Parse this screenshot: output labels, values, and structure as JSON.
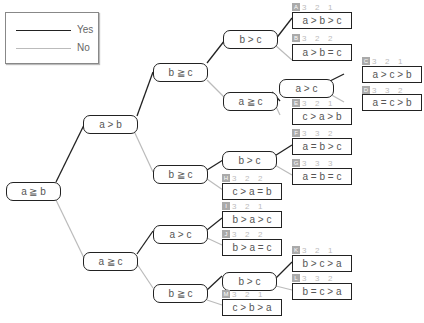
{
  "legend": {
    "yes_label": "Yes",
    "no_label": "No",
    "yes_color": "#222222",
    "no_color": "#bbbbbb"
  },
  "nodes": {
    "root": "a ≧ b",
    "n1": "a > b",
    "n1y": "b ≧ c",
    "n1yy": "b > c",
    "n1yn": "a ≧ c",
    "n1yna": "a > c",
    "n1n": "b ≧ c",
    "n1nb": "b > c",
    "n2": "a ≧ c",
    "n2y": "a > c",
    "n2n": "b ≧ c",
    "n2nb": "b > c"
  },
  "leaves": [
    {
      "id": "A",
      "text": "a > b > c",
      "scores": [
        "3",
        "2",
        "1"
      ]
    },
    {
      "id": "B",
      "text": "a > b = c",
      "scores": [
        "3",
        "2",
        "2"
      ]
    },
    {
      "id": "C",
      "text": "a > c > b",
      "scores": [
        "3",
        "2",
        "1"
      ]
    },
    {
      "id": "D",
      "text": "a = c > b",
      "scores": [
        "3",
        "3",
        "2"
      ]
    },
    {
      "id": "E",
      "text": "c > a > b",
      "scores": [
        "3",
        "2",
        "1"
      ]
    },
    {
      "id": "F",
      "text": "a = b > c",
      "scores": [
        "3",
        "3",
        "2"
      ]
    },
    {
      "id": "G",
      "text": "a = b = c",
      "scores": [
        "3",
        "3",
        "3"
      ]
    },
    {
      "id": "H",
      "text": "c > a = b",
      "scores": [
        "3",
        "2",
        "2"
      ]
    },
    {
      "id": "I",
      "text": "b > a > c",
      "scores": [
        "3",
        "2",
        "1"
      ]
    },
    {
      "id": "J",
      "text": "b > a = c",
      "scores": [
        "3",
        "2",
        "2"
      ]
    },
    {
      "id": "K",
      "text": "b > c > a",
      "scores": [
        "3",
        "2",
        "1"
      ]
    },
    {
      "id": "L",
      "text": "b = c > a",
      "scores": [
        "3",
        "3",
        "2"
      ]
    },
    {
      "id": "M",
      "text": "c > b > a",
      "scores": [
        "3",
        "2",
        "1"
      ]
    }
  ]
}
